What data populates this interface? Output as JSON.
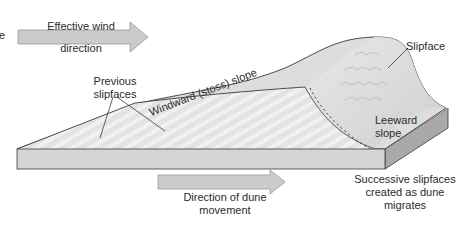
{
  "diagram": {
    "labels": {
      "cropped_left": "e",
      "wind_line1": "Effective wind",
      "wind_line2": "direction",
      "windward": "Windward (stoss) slope",
      "slipface": "Slipface",
      "previous_line1": "Previous",
      "previous_line2": "slipfaces",
      "leeward_line1": "Leeward",
      "leeward_line2": "slope",
      "movement_line1": "Direction of dune",
      "movement_line2": "movement",
      "successive_line1": "Successive slipfaces",
      "successive_line2": "created as dune",
      "successive_line3": "migrates"
    },
    "colors": {
      "arrow_fill": "#c9c9c9",
      "arrow_stroke": "#9a9a9a",
      "dune_fill": "#dedede",
      "dune_light": "#eeeeee",
      "slab_front": "#d4d4d4",
      "slab_side": "#a8a8a8",
      "outline": "#3a3a3a"
    }
  }
}
